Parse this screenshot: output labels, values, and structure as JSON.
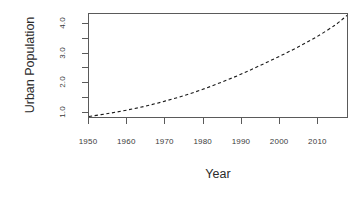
{
  "chart_data": {
    "type": "line",
    "title": "",
    "subtitle": "",
    "xlabel": "Year",
    "ylabel": "Urban Population",
    "xlim": [
      1950,
      2018
    ],
    "ylim": [
      0.78,
      4.35
    ],
    "grid": false,
    "legend": null,
    "legend_position": "none",
    "line_style": "dashed",
    "line_color": "#1a1a1a",
    "background_color": "#ffffff",
    "axis_color": "#5a5a5a",
    "frame": "box",
    "xticks": [
      1950,
      1960,
      1970,
      1980,
      1990,
      2000,
      2010
    ],
    "xtick_labels": [
      "1950",
      "1960",
      "1970",
      "1980",
      "1990",
      "2000",
      "2010"
    ],
    "yticks": [
      1.0,
      1.5,
      2.0,
      2.5,
      3.0,
      3.5,
      4.0
    ],
    "ytick_labels": [
      "1.0",
      "",
      "2.0",
      "",
      "3.0",
      "",
      "4.0"
    ],
    "series": [
      {
        "name": "Urban Population",
        "x": [
          1950,
          1955,
          1960,
          1965,
          1970,
          1975,
          1980,
          1985,
          1990,
          1995,
          2000,
          2005,
          2010,
          2015,
          2018
        ],
        "values": [
          0.8,
          0.9,
          1.02,
          1.16,
          1.33,
          1.52,
          1.74,
          1.99,
          2.26,
          2.56,
          2.87,
          3.2,
          3.56,
          3.98,
          4.3
        ]
      }
    ]
  },
  "axes": {
    "y_title": "Urban Population",
    "x_title": "Year"
  }
}
